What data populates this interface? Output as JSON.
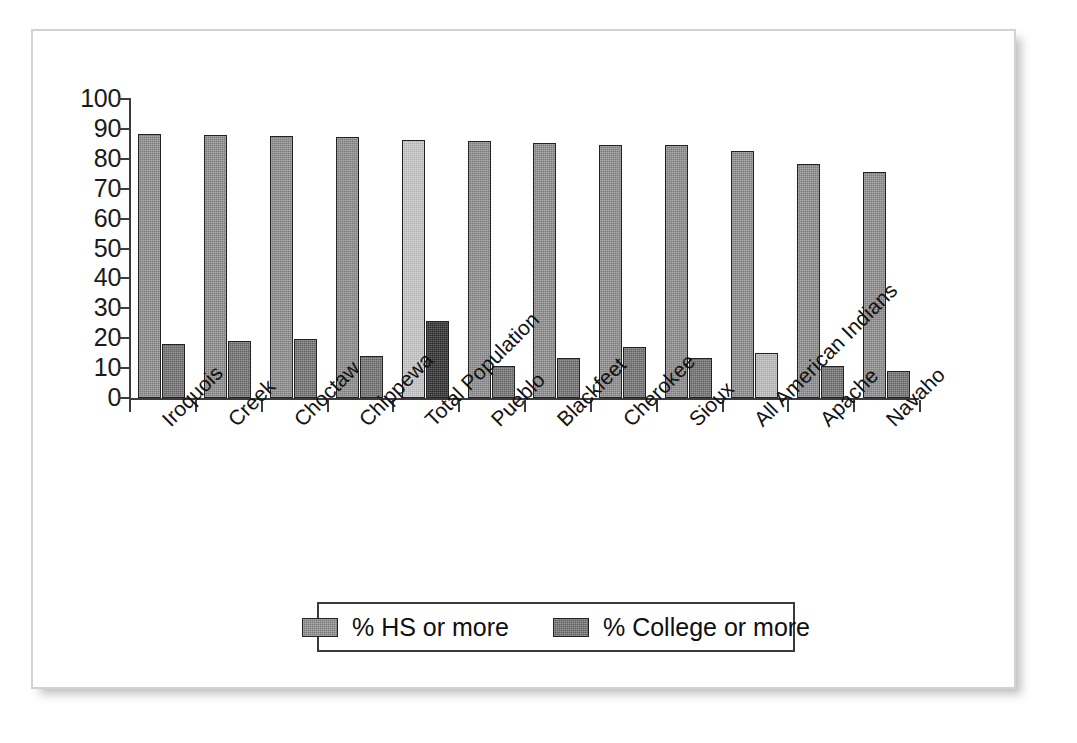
{
  "chart_data": {
    "type": "bar",
    "title": "",
    "subtitle": "",
    "xlabel": "",
    "ylabel": "",
    "ylim": [
      0,
      100
    ],
    "ytick_labels": [
      "100",
      "90",
      "80",
      "70",
      "60",
      "50",
      "40",
      "30",
      "20",
      "10",
      "0"
    ],
    "ytick_values": [
      100,
      90,
      80,
      70,
      60,
      50,
      40,
      30,
      20,
      10,
      0
    ],
    "ytick_step": 10,
    "grid": false,
    "legend_position": "bottom-center",
    "categories": [
      "Iroquois",
      "Creek",
      "Choctaw",
      "Chippewa",
      "Total Population",
      "Pueblo",
      "Blackfeet",
      "Cherokee",
      "Sioux",
      "All American Indians",
      "Apache",
      "Navaho"
    ],
    "series": [
      {
        "name": "% HS or more",
        "values": [
          88.3,
          88.0,
          87.5,
          87.2,
          86.3,
          85.8,
          85.2,
          84.7,
          84.6,
          82.7,
          78.4,
          75.5
        ]
      },
      {
        "name": "% College or more",
        "values": [
          18.0,
          19.2,
          19.8,
          14.1,
          25.8,
          10.8,
          13.5,
          16.9,
          13.4,
          15.2,
          10.7,
          9.0
        ]
      }
    ],
    "bar_colors": {
      "hs_default": "#8a8a8a",
      "college_default": "#6e6e6e",
      "hs_highlight": "#c6c6c6",
      "college_highlight_dark": "#2b2b2b",
      "college_highlight_light": "#bcbcbc",
      "bar_outline": "#222222"
    },
    "highlighted_categories": [
      "Total Population",
      "All American Indians"
    ],
    "series_color_overrides": [
      {
        "category": "Total Population",
        "series": "% HS or more",
        "color": "#c6c6c6"
      },
      {
        "category": "Total Population",
        "series": "% College or more",
        "color": "#2b2b2b"
      },
      {
        "category": "All American Indians",
        "series": "% College or more",
        "color": "#bcbcbc"
      }
    ]
  },
  "legend": {
    "entries": [
      {
        "label": "% HS or more",
        "swatch_color": "#8a8a8a",
        "icon": "legend-swatch-icon"
      },
      {
        "label": "% College or more",
        "swatch_color": "#6e6e6e",
        "icon": "legend-swatch-icon"
      }
    ]
  },
  "frame": {
    "border_color": "#d2d2d2",
    "background": "#ffffff",
    "axis_color": "#3c3c3c"
  }
}
